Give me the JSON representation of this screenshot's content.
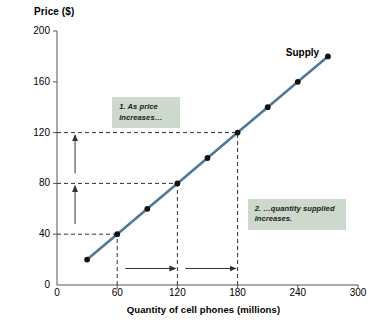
{
  "chart_data": {
    "type": "line",
    "title": "",
    "xlabel": "Quantity of cell phones (millions)",
    "ylabel": "Price ($)",
    "xlim": [
      0,
      300
    ],
    "ylim": [
      0,
      200
    ],
    "grid": false,
    "legend_position": "inline-right",
    "series": [
      {
        "name": "Supply",
        "color": "#4d7a94",
        "marker": "circle",
        "marker_color": "#111111",
        "x": [
          30,
          60,
          90,
          120,
          150,
          180,
          210,
          240,
          270
        ],
        "y": [
          20,
          40,
          60,
          80,
          100,
          120,
          140,
          160,
          180
        ]
      }
    ],
    "xticks": [
      {
        "value": 0,
        "label": "0"
      },
      {
        "value": 60,
        "label": "60"
      },
      {
        "value": 120,
        "label": "120"
      },
      {
        "value": 180,
        "label": "180"
      },
      {
        "value": 240,
        "label": "240"
      },
      {
        "value": 300,
        "label": "300"
      }
    ],
    "yticks": [
      {
        "value": 0,
        "label": "0"
      },
      {
        "value": 40,
        "label": "40"
      },
      {
        "value": 80,
        "label": "80"
      },
      {
        "value": 120,
        "label": "120"
      },
      {
        "value": 160,
        "label": "160"
      },
      {
        "value": 200,
        "label": "200"
      }
    ],
    "guides": [
      {
        "type": "hline",
        "y": 120,
        "from_x": 0,
        "to_x": 180,
        "style": "dashed"
      },
      {
        "type": "hline",
        "y": 80,
        "from_x": 0,
        "to_x": 120,
        "style": "dashed"
      },
      {
        "type": "hline",
        "y": 40,
        "from_x": 0,
        "to_x": 60,
        "style": "dashed"
      },
      {
        "type": "vline",
        "x": 180,
        "from_y": 0,
        "to_y": 120,
        "style": "dashed"
      },
      {
        "type": "vline",
        "x": 120,
        "from_y": 0,
        "to_y": 80,
        "style": "dashed"
      },
      {
        "type": "vline",
        "x": 60,
        "from_y": 0,
        "to_y": 40,
        "style": "dashed"
      }
    ],
    "arrows": [
      {
        "type": "vertical-up",
        "x": 18,
        "from_y": 88,
        "to_y": 118
      },
      {
        "type": "vertical-up",
        "x": 18,
        "from_y": 48,
        "to_y": 78
      },
      {
        "type": "horizontal-right",
        "y": 13,
        "from_x": 68,
        "to_x": 118
      },
      {
        "type": "horizontal-right",
        "y": 13,
        "from_x": 128,
        "to_x": 178
      }
    ],
    "annotations": [
      {
        "id": "callout-1",
        "line1": "1.  As price",
        "line2": "increases…",
        "at_x": 55,
        "at_y": 148
      },
      {
        "id": "callout-2",
        "line1": "2. …quantity supplied",
        "line2": "increases.",
        "at_x": 190,
        "at_y": 68
      }
    ],
    "series_label": {
      "text": "Supply",
      "at_x": 240,
      "at_y": 178
    }
  },
  "colors": {
    "curve": "#4d7a94",
    "marker": "#111111",
    "axis": "#555555",
    "guide": "#333333",
    "callout_bg": "#cdd9cd",
    "text": "#000000"
  }
}
